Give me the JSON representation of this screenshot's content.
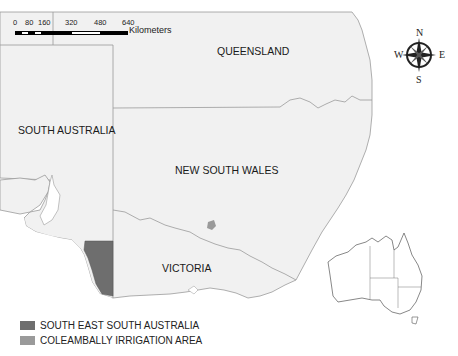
{
  "map": {
    "regions": [
      {
        "name": "QUEENSLAND",
        "x": 217,
        "y": 45
      },
      {
        "name": "SOUTH AUSTRALIA",
        "x": 18,
        "y": 124
      },
      {
        "name": "NEW SOUTH WALES",
        "x": 175,
        "y": 164
      },
      {
        "name": "VICTORIA",
        "x": 162,
        "y": 262
      }
    ],
    "highlights": [
      {
        "name": "SOUTH EAST SOUTH AUSTRALIA",
        "color": "#6e6e6e"
      },
      {
        "name": "COLEAMBALLY IRRIGATION AREA",
        "color": "#9a9a9a"
      }
    ]
  },
  "scale_bar": {
    "ticks": [
      "0",
      "80",
      "160",
      "320",
      "480",
      "640"
    ],
    "unit": "Kilometers"
  },
  "compass": {
    "n": "N",
    "s": "S",
    "e": "E",
    "w": "W"
  },
  "legend": {
    "items": [
      {
        "label": "SOUTH EAST SOUTH AUSTRALIA",
        "color": "#6e6e6e"
      },
      {
        "label": "COLEAMBALLY IRRIGATION AREA",
        "color": "#9a9a9a"
      }
    ]
  },
  "inset": {
    "name": "Australia locator map"
  }
}
